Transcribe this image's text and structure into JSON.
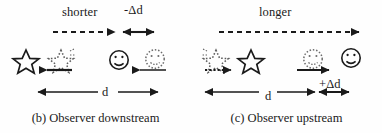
{
  "figure": {
    "type": "physics-doppler-diagram",
    "background_color": "#fefefe",
    "ink_color": "#1a1a1a"
  },
  "panels": [
    {
      "id": "b",
      "caption": "(b) Observer downstream",
      "top_label": "shorter",
      "delta_label": "-Δd",
      "distance_label": "d",
      "source": {
        "icon": "star-icon",
        "current_state": "solid",
        "previous_state": "dotted",
        "motion_direction": "left",
        "motion_arrow": "leftward-arrow-solid"
      },
      "observer": {
        "icon": "smiley-face-icon",
        "current_state": "solid",
        "previous_state": "dotted",
        "motion_direction": "left",
        "motion_arrow": "leftward-arrow-thin"
      },
      "top_arrow": {
        "style": "dashed",
        "head": "right",
        "meaning": "wave travel shortened"
      },
      "delta_arrow": {
        "style": "solid",
        "head": "both",
        "meaning": "negative distance change"
      },
      "distance_arrow": {
        "style": "solid",
        "head": "both",
        "meaning": "separation distance d"
      }
    },
    {
      "id": "c",
      "caption": "(c) Observer upstream",
      "top_label": "longer",
      "delta_label": "+Δd",
      "distance_label": "d",
      "source": {
        "icon": "star-icon",
        "current_state": "solid",
        "previous_state": "dotted",
        "motion_direction": "right",
        "motion_arrow": "rightward-arrow-dotted"
      },
      "observer": {
        "icon": "smiley-face-icon",
        "current_state": "solid",
        "previous_state": "dotted",
        "motion_direction": "right",
        "motion_arrow": "rightward-arrow-solid"
      },
      "top_arrow": {
        "style": "dashed",
        "head": "right",
        "meaning": "wave travel lengthened"
      },
      "delta_arrow": {
        "style": "solid",
        "head": "both",
        "meaning": "positive distance change"
      },
      "distance_arrow": {
        "style": "solid",
        "head": "both",
        "meaning": "separation distance d"
      }
    }
  ]
}
